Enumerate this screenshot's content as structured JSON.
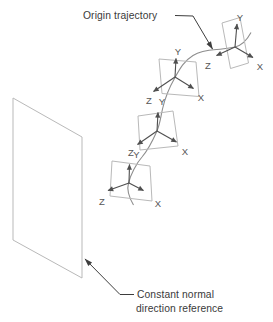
{
  "annotations": {
    "origin_trajectory": "Origin trajectory",
    "constant_normal_line1": "Constant normal",
    "constant_normal_line2": "direction reference"
  },
  "frames": [
    {
      "id": "frame-1-top-right",
      "x": "X",
      "y": "Y",
      "z": "Z"
    },
    {
      "id": "frame-2",
      "x": "X",
      "y": "Y",
      "z": "Z"
    },
    {
      "id": "frame-3",
      "x": "X",
      "y": "Y",
      "z": "Z"
    },
    {
      "id": "frame-4-bottom",
      "x": "X",
      "y": "Y",
      "z": "Z"
    }
  ],
  "colors": {
    "background": "#ffffff",
    "plane_stroke": "#b9b9b9",
    "curve_stroke": "#8e8e8e",
    "axis_stroke": "#4f4f4f",
    "leader_stroke": "#3d3d3d",
    "label_text": "#3a3a3a",
    "axis_label_text": "#565656"
  }
}
